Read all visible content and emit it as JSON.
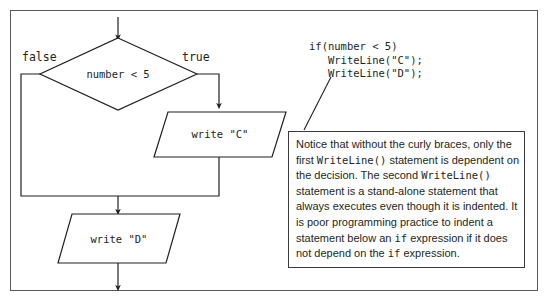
{
  "figure": {
    "frame_color": "#58595b",
    "ink_color": "#231f20"
  },
  "flowchart": {
    "decision": {
      "label": "number < 5",
      "shape": "diamond"
    },
    "branches": {
      "false_label": "false",
      "true_label": "true"
    },
    "process_true": {
      "label": "write \"C\"",
      "shape": "parallelogram"
    },
    "process_join": {
      "label": "write \"D\"",
      "shape": "parallelogram"
    }
  },
  "code": {
    "lines": [
      "if(number < 5)",
      "   WriteLine(\"C\");",
      "   WriteLine(\"D\");"
    ],
    "text": "if(number < 5)\n   WriteLine(\"C\");\n   WriteLine(\"D\");"
  },
  "note": {
    "segments": [
      {
        "type": "text",
        "value": "Notice that without the curly braces, only the first "
      },
      {
        "type": "code",
        "value": "WriteLine()"
      },
      {
        "type": "text",
        "value": " statement is dependent on the decision. The second "
      },
      {
        "type": "code",
        "value": "WriteLine()"
      },
      {
        "type": "text",
        "value": " statement is a stand-alone statement that always executes even though it is indented. It is poor programming practice to indent a statement below an "
      },
      {
        "type": "code",
        "value": "if"
      },
      {
        "type": "text",
        "value": " expression if it does not depend on the "
      },
      {
        "type": "code",
        "value": "if"
      },
      {
        "type": "text",
        "value": " expression."
      }
    ],
    "plain": "Notice that without the curly braces, only the first WriteLine() statement is dependent on the decision. The second WriteLine() statement is a stand-alone statement that always executes even though it is indented. It is poor programming practice to indent a statement below an if expression if it does not depend on the if expression."
  }
}
